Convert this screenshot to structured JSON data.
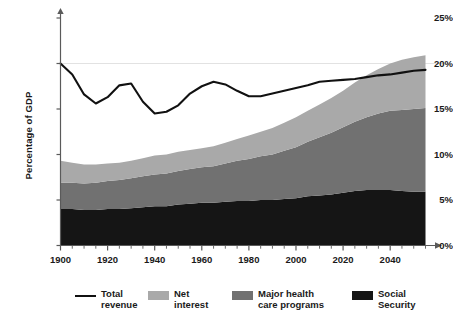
{
  "chart_data": {
    "type": "area",
    "title": "",
    "subtitle": "",
    "xlabel": "",
    "ylabel": "Percentage of GDP",
    "xlim": [
      1900,
      2055
    ],
    "ylim": [
      0,
      25
    ],
    "grid": "horizontal gridline at 20%",
    "stacked": true,
    "legend_position": "bottom",
    "y_tick_labels": [
      "0%",
      "5%",
      "10%",
      "15%",
      "20%",
      "25%"
    ],
    "y_tick_values": [
      0,
      5,
      10,
      15,
      20,
      25
    ],
    "x_tick_labels": [
      "1900",
      "1920",
      "1940",
      "1960",
      "1980",
      "2000",
      "2020",
      "2040"
    ],
    "x_tick_values": [
      1900,
      1920,
      1940,
      1960,
      1980,
      2000,
      2020,
      2040
    ],
    "x_minor_tick_interval": 5,
    "x": [
      1900,
      1905,
      1910,
      1915,
      1920,
      1925,
      1930,
      1935,
      1940,
      1945,
      1950,
      1955,
      1960,
      1965,
      1970,
      1975,
      1980,
      1985,
      1990,
      1995,
      2000,
      2005,
      2010,
      2015,
      2020,
      2025,
      2030,
      2035,
      2040,
      2045,
      2050,
      2055
    ],
    "series": [
      {
        "name": "Social Security",
        "color": "#151515",
        "type": "stacked-area",
        "values": [
          4.0,
          4.0,
          3.9,
          3.9,
          4.0,
          4.0,
          4.1,
          4.2,
          4.3,
          4.3,
          4.5,
          4.6,
          4.7,
          4.7,
          4.8,
          4.9,
          4.9,
          5.0,
          5.0,
          5.1,
          5.2,
          5.4,
          5.5,
          5.6,
          5.8,
          6.0,
          6.1,
          6.1,
          6.1,
          6.0,
          5.9,
          5.9
        ]
      },
      {
        "name": "Major health care programs",
        "color": "#717171",
        "type": "stacked-area",
        "values": [
          2.9,
          2.9,
          2.9,
          3.0,
          3.1,
          3.2,
          3.3,
          3.4,
          3.5,
          3.6,
          3.7,
          3.8,
          3.9,
          4.0,
          4.2,
          4.4,
          4.6,
          4.8,
          5.0,
          5.3,
          5.6,
          6.0,
          6.4,
          6.8,
          7.2,
          7.6,
          8.0,
          8.4,
          8.7,
          8.9,
          9.1,
          9.2
        ]
      },
      {
        "name": "Net interest",
        "color": "#a9a9a9",
        "type": "stacked-area",
        "values": [
          2.4,
          2.2,
          2.1,
          2.0,
          1.9,
          1.9,
          1.9,
          2.0,
          2.1,
          2.1,
          2.1,
          2.1,
          2.1,
          2.2,
          2.3,
          2.4,
          2.6,
          2.7,
          2.9,
          3.1,
          3.3,
          3.4,
          3.6,
          3.8,
          4.0,
          4.3,
          4.6,
          4.9,
          5.2,
          5.5,
          5.7,
          5.8
        ]
      },
      {
        "name": "Total revenue",
        "color": "#111111",
        "type": "line",
        "values": [
          20.0,
          18.8,
          16.6,
          15.6,
          16.3,
          17.6,
          17.8,
          15.8,
          14.5,
          14.7,
          15.4,
          16.7,
          17.5,
          18.0,
          17.7,
          17.0,
          16.4,
          16.4,
          16.7,
          17.0,
          17.3,
          17.6,
          18.0,
          18.1,
          18.2,
          18.3,
          18.5,
          18.7,
          18.8,
          19.0,
          19.2,
          19.3
        ]
      }
    ]
  },
  "axis": {
    "y_label": "Percentage of GDP",
    "y_ticks": [
      "25%",
      "20%",
      "15%",
      "10%",
      "5%",
      "0%"
    ],
    "x_ticks": [
      "1900",
      "1920",
      "1940",
      "1960",
      "1980",
      "2000",
      "2020",
      "2040"
    ]
  },
  "legend": {
    "items": [
      {
        "label": "Total\nrevenue",
        "swatch": "line",
        "color": "#111111"
      },
      {
        "label": "Net\ninterest",
        "swatch": "fill",
        "color": "#a9a9a9"
      },
      {
        "label": "Major health\ncare programs",
        "swatch": "fill",
        "color": "#717171"
      },
      {
        "label": "Social\nSecurity",
        "swatch": "fill",
        "color": "#151515"
      }
    ]
  },
  "colors": {
    "social_security": "#151515",
    "major_health": "#717171",
    "net_interest": "#a9a9a9",
    "total_revenue_line": "#111111",
    "axis": "#5a5a5a",
    "gridline": "#e2e2e2",
    "background": "#ffffff"
  }
}
